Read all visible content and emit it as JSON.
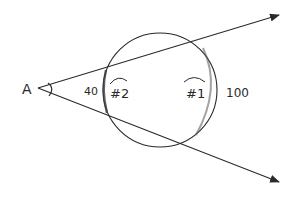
{
  "diagram": {
    "vertex_label": "A",
    "circle": {
      "center": [
        160,
        90
      ],
      "radius": 57
    },
    "labels": {
      "near_distance": "40",
      "far_distance": "100",
      "near_point": "#2",
      "far_point": "#1"
    },
    "rays": [
      {
        "name": "upper-ray",
        "from": [
          38,
          88
        ],
        "to": [
          280,
          14
        ]
      },
      {
        "name": "lower-ray",
        "from": [
          38,
          88
        ],
        "to": [
          280,
          183
        ]
      }
    ],
    "colors": {
      "stroke": "#2a2a2a",
      "background": "#ffffff"
    }
  }
}
